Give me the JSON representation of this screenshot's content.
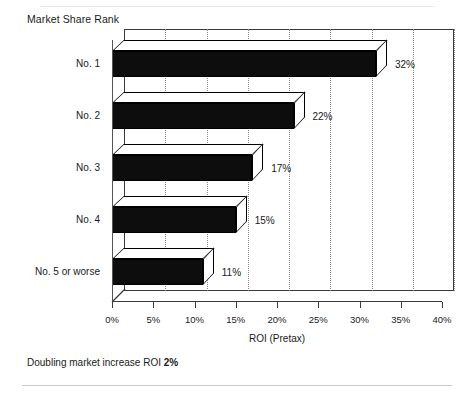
{
  "chart_data": {
    "type": "bar",
    "orientation": "horizontal",
    "title": "",
    "categories": [
      "No. 1",
      "No. 2",
      "No. 3",
      "No. 4",
      "No. 5 or worse"
    ],
    "values": [
      32,
      22,
      17,
      15,
      11
    ],
    "value_labels": [
      "32%",
      "22%",
      "17%",
      "15%",
      "11%"
    ],
    "xlabel": "ROI (Pretax)",
    "ylabel": "Market Share Rank",
    "xlim": [
      0,
      40
    ],
    "xticks": [
      0,
      5,
      10,
      15,
      20,
      25,
      30,
      35,
      40
    ],
    "xticklabels": [
      "0%",
      "5%",
      "10%",
      "15%",
      "20%",
      "25%",
      "30%",
      "35%",
      "40%"
    ],
    "grid": true,
    "grid_axis": "x",
    "grid_style": "dotted",
    "legend": false,
    "style": "3d-extruded-bars",
    "bar_color": "#0d0d0d",
    "frame_color": "#3a3a3a"
  },
  "footnote": {
    "text_before": "Doubling market increase ROI ",
    "emphasis": "2%"
  }
}
